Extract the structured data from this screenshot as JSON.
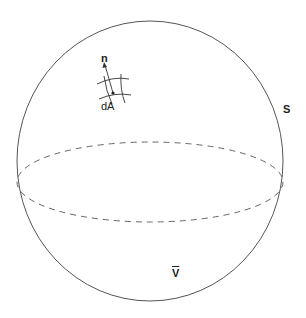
{
  "diagram": {
    "type": "sphere-surface-element",
    "labels": {
      "normal": "n",
      "area_element": "dA",
      "surface": "S",
      "volume": "V"
    },
    "shapes": {
      "sphere": {
        "cx": 150,
        "cy": 161,
        "rx": 133,
        "ry": 140,
        "stroke": "#555555"
      },
      "equator": {
        "cx": 150,
        "cy": 182,
        "rx": 133,
        "ry": 40,
        "stroke": "#666666",
        "dash": "6 5"
      },
      "normal_vector": {
        "from": [
          113,
          93
        ],
        "to": [
          105,
          64
        ]
      },
      "patch_point": [
        113,
        93
      ]
    },
    "colors": {
      "line": "#555555",
      "text": "#222222",
      "background": "#ffffff"
    }
  }
}
